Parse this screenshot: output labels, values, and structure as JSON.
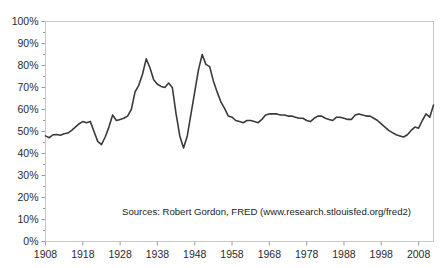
{
  "chart_data": {
    "type": "line",
    "title": "",
    "xlabel": "",
    "ylabel": "",
    "xlim": [
      1908,
      2012
    ],
    "ylim": [
      0,
      100
    ],
    "grid": false,
    "legend": null,
    "y_tick_labels": [
      "0%",
      "10%",
      "20%",
      "30%",
      "40%",
      "50%",
      "60%",
      "70%",
      "80%",
      "90%",
      "100%"
    ],
    "y_tick_values": [
      0,
      10,
      20,
      30,
      40,
      50,
      60,
      70,
      80,
      90,
      100
    ],
    "x_tick_labels": [
      "1908",
      "1918",
      "1928",
      "1938",
      "1948",
      "1958",
      "1968",
      "1978",
      "1988",
      "1998",
      "2008"
    ],
    "x_tick_values": [
      1908,
      1918,
      1928,
      1938,
      1948,
      1958,
      1968,
      1978,
      1988,
      1998,
      2008
    ],
    "annotations": [
      {
        "name": "source-note",
        "text": "Sources: Robert Gordon, FRED (www.research.stlouisfed.org/fred2)"
      }
    ],
    "series": [
      {
        "name": "ratio",
        "color": "#3a3a3a",
        "x": [
          1908,
          1909,
          1910,
          1911,
          1912,
          1913,
          1914,
          1915,
          1916,
          1917,
          1918,
          1919,
          1920,
          1921,
          1922,
          1923,
          1924,
          1925,
          1926,
          1927,
          1928,
          1929,
          1930,
          1931,
          1932,
          1933,
          1934,
          1935,
          1936,
          1937,
          1938,
          1939,
          1940,
          1941,
          1942,
          1943,
          1944,
          1945,
          1946,
          1947,
          1948,
          1949,
          1950,
          1951,
          1952,
          1953,
          1954,
          1955,
          1956,
          1957,
          1958,
          1959,
          1960,
          1961,
          1962,
          1963,
          1964,
          1965,
          1966,
          1967,
          1968,
          1969,
          1970,
          1971,
          1972,
          1973,
          1974,
          1975,
          1976,
          1977,
          1978,
          1979,
          1980,
          1981,
          1982,
          1983,
          1984,
          1985,
          1986,
          1987,
          1988,
          1989,
          1990,
          1991,
          1992,
          1993,
          1994,
          1995,
          1996,
          1997,
          1998,
          1999,
          2000,
          2001,
          2002,
          2003,
          2004,
          2005,
          2006,
          2007,
          2008,
          2009,
          2010,
          2011,
          2012
        ],
        "values": [
          48.0,
          47.2,
          48.5,
          48.6,
          48.3,
          49.0,
          49.3,
          50.5,
          52.0,
          53.5,
          54.5,
          54.0,
          54.6,
          50.0,
          45.5,
          44.0,
          47.5,
          52.0,
          57.5,
          55.0,
          55.5,
          56.0,
          57.0,
          60.0,
          68.0,
          71.0,
          76.0,
          83.0,
          79.0,
          73.5,
          71.5,
          70.5,
          70.0,
          72.0,
          70.0,
          58.0,
          48.0,
          42.5,
          48.0,
          58.0,
          68.0,
          78.0,
          85.0,
          80.5,
          79.5,
          73.0,
          68.0,
          63.5,
          60.5,
          57.0,
          56.5,
          55.0,
          54.5,
          54.0,
          55.0,
          55.0,
          54.5,
          54.0,
          55.5,
          57.5,
          58.0,
          58.0,
          58.0,
          57.5,
          57.5,
          57.0,
          57.0,
          56.5,
          56.0,
          56.0,
          55.0,
          54.5,
          56.0,
          57.0,
          57.0,
          56.0,
          55.5,
          55.0,
          56.5,
          56.5,
          56.0,
          55.5,
          55.5,
          57.5,
          58.0,
          57.5,
          57.0,
          57.0,
          56.0,
          55.0,
          53.5,
          52.0,
          50.5,
          49.5,
          48.5,
          48.0,
          47.5,
          48.5,
          50.5,
          52.0,
          51.5,
          55.0,
          58.0,
          56.5,
          62.0
        ]
      }
    ]
  }
}
